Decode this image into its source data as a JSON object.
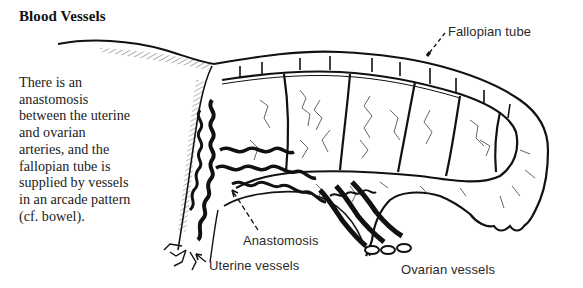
{
  "section": {
    "title": "Blood Vessels",
    "body_lines": [
      "There is an",
      "anastomosis",
      "between the uterine",
      "and ovarian",
      "arteries, and the",
      "fallopian tube is",
      "supplied by vessels",
      "in an arcade pattern",
      "(cf. bowel)."
    ]
  },
  "figure": {
    "labels": {
      "fallopian_tube": "Fallopian tube",
      "anastomosis": "Anastomosis",
      "uterine_vessels": "Uterine vessels",
      "ovarian_vessels": "Ovarian vessels"
    },
    "colors": {
      "ink": "#111111",
      "paper": "#ffffff"
    }
  }
}
